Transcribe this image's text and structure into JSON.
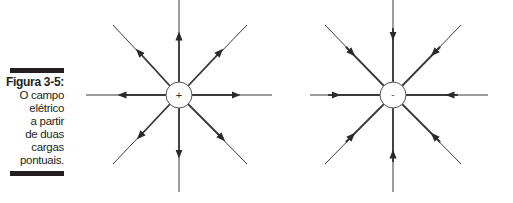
{
  "figure": {
    "label": "Figura 3-5:",
    "caption_lines": [
      "O campo",
      "elétrico",
      "a partir",
      "de duas",
      "cargas",
      "pontuais."
    ]
  },
  "charges": [
    {
      "sign": "+",
      "name": "positive-charge",
      "field_direction": "outward",
      "cx": 179,
      "cy": 95
    },
    {
      "sign": "-",
      "name": "negative-charge",
      "field_direction": "inward",
      "cx": 393,
      "cy": 95
    }
  ],
  "colors": {
    "line": "#3a3a3a",
    "text": "#231f20"
  }
}
